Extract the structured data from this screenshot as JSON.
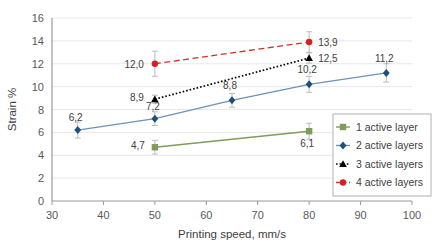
{
  "chart_data": {
    "type": "line",
    "title": "",
    "xlabel": "Printing speed, mm/s",
    "ylabel": "Strain %",
    "xlim": [
      30,
      100
    ],
    "ylim": [
      0,
      16
    ],
    "xticks": [
      "30",
      "40",
      "50",
      "60",
      "70",
      "80",
      "90",
      "100"
    ],
    "yticks": [
      "0",
      "2",
      "4",
      "6",
      "8",
      "10",
      "12",
      "14",
      "16"
    ],
    "grid": "horizontal",
    "legend_position": "lower-right",
    "series": [
      {
        "name": "1 active layer",
        "color": "#7f9c5a",
        "marker": "square",
        "linestyle": "solid",
        "x": [
          50,
          80
        ],
        "y": [
          4.7,
          6.1
        ],
        "labels": [
          "4,7",
          "6,1"
        ],
        "errors": [
          0.6,
          0.7
        ]
      },
      {
        "name": "2 active layers",
        "color": "#1f4e79",
        "line_color": "#6a93b8",
        "marker": "diamond",
        "linestyle": "solid",
        "x": [
          35,
          50,
          65,
          80,
          95
        ],
        "y": [
          6.2,
          7.2,
          8.8,
          10.2,
          11.2
        ],
        "labels": [
          "6,2",
          "7,2",
          "8,8",
          "10,2",
          "11,2"
        ],
        "errors": [
          0.7,
          0.6,
          0.6,
          0.7,
          0.8
        ]
      },
      {
        "name": "3 active layers",
        "color": "#000000",
        "marker": "triangle",
        "linestyle": "dotted",
        "x": [
          50,
          80
        ],
        "y": [
          8.9,
          12.5
        ],
        "labels": [
          "8,9",
          "12,5"
        ],
        "errors": [
          0.35,
          0.45
        ]
      },
      {
        "name": "4 active layers",
        "color": "#d81f26",
        "line_color": "#c0392b",
        "marker": "circle",
        "linestyle": "dashed",
        "x": [
          50,
          80
        ],
        "y": [
          12.0,
          13.9
        ],
        "labels": [
          "12,0",
          "13,9"
        ],
        "errors": [
          1.1,
          0.9
        ]
      }
    ]
  }
}
